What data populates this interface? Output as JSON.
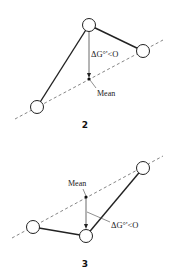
{
  "diagrams": [
    {
      "id": "2",
      "label": "2",
      "mean_label": "Mean",
      "delta_g_label": "ΔG°'<O",
      "nodes": [
        {
          "name": "top",
          "x": 89,
          "y": 25
        },
        {
          "name": "right",
          "x": 143,
          "y": 51
        },
        {
          "name": "bottom-left",
          "x": 37,
          "y": 107
        }
      ],
      "mean_point": {
        "x": 89,
        "y": 79
      },
      "dashed_line": {
        "x1": 15,
        "y1": 119,
        "x2": 163,
        "y2": 40
      }
    },
    {
      "id": "3",
      "label": "3",
      "mean_label": "Mean",
      "delta_g_label": "ΔG°'<O",
      "nodes": [
        {
          "name": "top-right",
          "x": 143,
          "y": 168
        },
        {
          "name": "left",
          "x": 33,
          "y": 227
        },
        {
          "name": "bottom",
          "x": 86,
          "y": 236
        }
      ],
      "mean_point": {
        "x": 86,
        "y": 197
      },
      "dashed_line": {
        "x1": 12,
        "y1": 238,
        "x2": 163,
        "y2": 156
      }
    }
  ],
  "colors": {
    "stroke": "#222222",
    "dashed": "#555555",
    "node_fill": "#ffffff",
    "text": "#222222"
  }
}
